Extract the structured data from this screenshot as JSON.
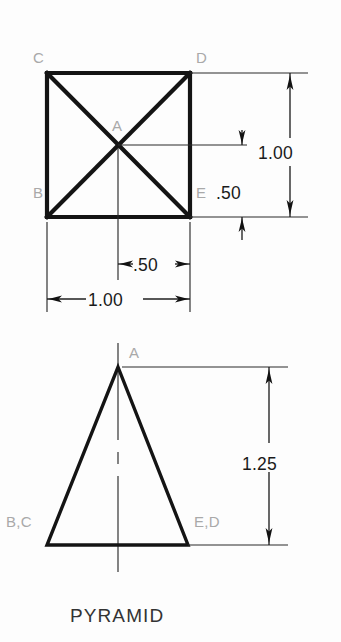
{
  "drawing": {
    "title": "PYRAMID",
    "units_note": "",
    "views": {
      "top": {
        "name": "top-view",
        "shape": "square-with-diagonals",
        "vertex_labels": [
          {
            "id": "C",
            "text": "C",
            "x": 33,
            "y": 63
          },
          {
            "id": "D",
            "text": "D",
            "x": 196,
            "y": 63
          },
          {
            "id": "A",
            "text": "A",
            "x": 112,
            "y": 131
          },
          {
            "id": "B",
            "text": "B",
            "x": 33,
            "y": 198
          },
          {
            "id": "E",
            "text": "E",
            "x": 196,
            "y": 198
          }
        ],
        "dimensions": [
          {
            "id": "top-height-1.00",
            "value": "1.00",
            "orientation": "vertical",
            "label_x": 299,
            "label_y": 152
          },
          {
            "id": "top-half-height-.50",
            "value": ".50",
            "orientation": "vertical",
            "label_x": 229,
            "label_y": 193
          },
          {
            "id": "top-half-width-.50",
            "value": ".50",
            "orientation": "horizontal",
            "label_x": 135,
            "label_y": 270
          },
          {
            "id": "top-width-1.00",
            "value": "1.00",
            "orientation": "horizontal",
            "label_x": 83,
            "label_y": 306
          }
        ]
      },
      "front": {
        "name": "front-view",
        "shape": "isosceles-triangle",
        "vertex_labels": [
          {
            "id": "A",
            "text": "A",
            "x": 129,
            "y": 358
          },
          {
            "id": "B,C",
            "text": "B,C",
            "x": 6,
            "y": 527
          },
          {
            "id": "E,D",
            "text": "E,D",
            "x": 194,
            "y": 527
          }
        ],
        "dimensions": [
          {
            "id": "front-height-1.25",
            "value": "1.25",
            "orientation": "vertical",
            "label_x": 278,
            "label_y": 463
          }
        ]
      }
    }
  }
}
